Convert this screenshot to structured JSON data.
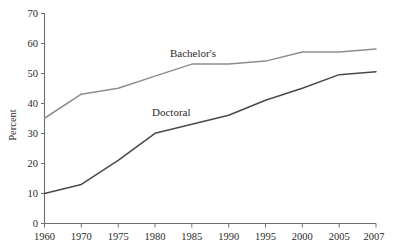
{
  "chart_data": {
    "type": "line",
    "title": "",
    "subtitle": "",
    "xlabel": "",
    "ylabel": "Percent",
    "x": [
      "1960",
      "1970",
      "1975",
      "1980",
      "1985",
      "1990",
      "1995",
      "2000",
      "2005",
      "2007"
    ],
    "categories": [
      "1960",
      "1970",
      "1975",
      "1980",
      "1985",
      "1990",
      "1995",
      "2000",
      "2005",
      "2007"
    ],
    "ylim": [
      0,
      70
    ],
    "yticks": [
      0,
      10,
      20,
      30,
      40,
      50,
      60,
      70
    ],
    "ytick_labels": [
      "0",
      "10",
      "20",
      "30",
      "40",
      "50",
      "60",
      "70"
    ],
    "xtick_labels": [
      "1960",
      "1970",
      "1975",
      "1980",
      "1985",
      "1990",
      "1995",
      "2000",
      "2005",
      "2007"
    ],
    "grid": false,
    "legend": "inline-annotations",
    "series": [
      {
        "name": "Bachelor's",
        "color": "#8d8d8d",
        "values": [
          35,
          43,
          45,
          49,
          53,
          53,
          54,
          57,
          57,
          58
        ]
      },
      {
        "name": "Doctoral",
        "color": "#4a4a4a",
        "values": [
          10,
          13,
          21,
          30,
          33,
          36,
          41,
          45,
          49.5,
          50.5
        ]
      }
    ],
    "annotations": [
      {
        "text": "Bachelor's",
        "x_px": 170,
        "y_px": 57
      },
      {
        "text": "Doctoral",
        "x_px": 152,
        "y_px": 116
      }
    ]
  },
  "axes": {
    "y_axis_title": "Percent",
    "y_tick_0": "0",
    "y_tick_10": "10",
    "y_tick_20": "20",
    "y_tick_30": "30",
    "y_tick_40": "40",
    "y_tick_50": "50",
    "y_tick_60": "60",
    "y_tick_70": "70",
    "x_tick_1": "1960",
    "x_tick_2": "1970",
    "x_tick_3": "1975",
    "x_tick_4": "1980",
    "x_tick_5": "1985",
    "x_tick_6": "1990",
    "x_tick_7": "1995",
    "x_tick_8": "2000",
    "x_tick_9": "2005",
    "x_tick_10": "2007"
  },
  "labels": {
    "bachelors": "Bachelor's",
    "doctoral": "Doctoral"
  }
}
